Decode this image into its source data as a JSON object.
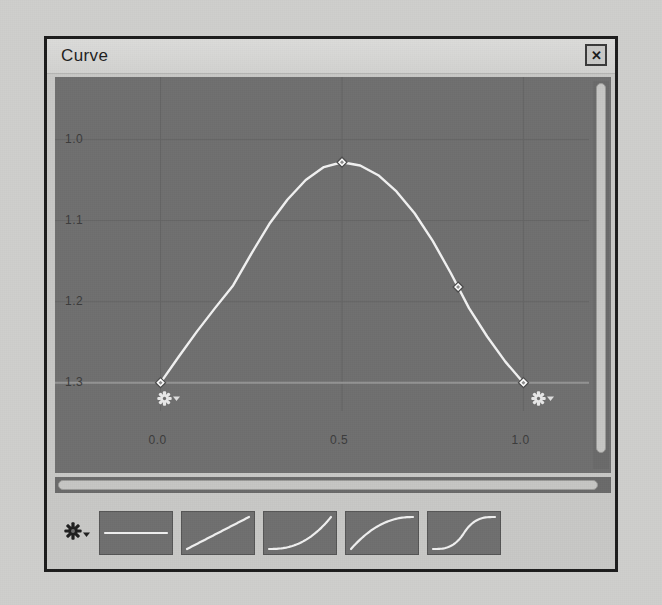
{
  "window": {
    "title": "Curve",
    "close_label": "✕",
    "close_icon": "close-icon"
  },
  "plot": {
    "y_ticks": [
      "1.3",
      "1.2",
      "1.1",
      "1.0"
    ],
    "x_ticks": [
      "0.0",
      "0.5",
      "1.0"
    ],
    "gear_icon": "gear-icon",
    "dropdown_icon": "chevron-down-icon",
    "left_handle_name": "left-endpoint-options",
    "right_handle_name": "right-endpoint-options",
    "curve_color": "#f2f2f2",
    "canvas_color": "#6f6f6f",
    "grid_color": "#646464"
  },
  "chart_data": {
    "type": "line",
    "title": "Curve",
    "xlabel": "",
    "ylabel": "",
    "xlim": [
      -0.12,
      1.12
    ],
    "ylim": [
      0.97,
      1.35
    ],
    "xticks": [
      0.0,
      0.5,
      1.0
    ],
    "yticks": [
      1.0,
      1.1,
      1.2,
      1.3
    ],
    "grid": true,
    "legend": "none",
    "series": [
      {
        "name": "curve",
        "x": [
          0.0,
          0.05,
          0.1,
          0.15,
          0.2,
          0.25,
          0.3,
          0.35,
          0.4,
          0.45,
          0.5,
          0.55,
          0.6,
          0.65,
          0.7,
          0.75,
          0.8,
          0.85,
          0.9,
          0.95,
          1.0
        ],
        "y": [
          1.0,
          1.032,
          1.063,
          1.092,
          1.12,
          1.159,
          1.196,
          1.226,
          1.25,
          1.266,
          1.272,
          1.268,
          1.256,
          1.236,
          1.209,
          1.175,
          1.135,
          1.092,
          1.057,
          1.026,
          1.0
        ]
      }
    ],
    "control_points": [
      {
        "x": 0.0,
        "y": 1.0,
        "label": "start-point"
      },
      {
        "x": 0.5,
        "y": 1.272,
        "label": "peak-point"
      },
      {
        "x": 0.82,
        "y": 1.118,
        "label": "mid-right-point"
      },
      {
        "x": 1.0,
        "y": 1.0,
        "label": "end-point"
      }
    ]
  },
  "scrollbars": {
    "vertical_name": "vertical-scrollbar",
    "horizontal_name": "horizontal-scrollbar"
  },
  "presets": {
    "gear_icon": "gear-icon",
    "dropdown_icon": "chevron-down-icon",
    "items": [
      {
        "name": "preset-constant",
        "shape": "constant"
      },
      {
        "name": "preset-linear",
        "shape": "linear"
      },
      {
        "name": "preset-ease-in",
        "shape": "ease-in"
      },
      {
        "name": "preset-ease-out",
        "shape": "ease-out"
      },
      {
        "name": "preset-ease-in-out",
        "shape": "ease-in-out"
      }
    ]
  }
}
